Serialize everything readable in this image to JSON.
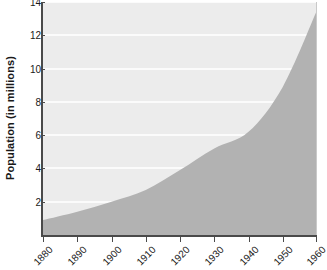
{
  "chart_data": {
    "type": "area",
    "title": "",
    "xlabel": "",
    "ylabel": "Population (in millions)",
    "xlim": [
      1880,
      1960
    ],
    "ylim": [
      0,
      14
    ],
    "grid": true,
    "legend": "none",
    "x_ticks": [
      "1880",
      "1890",
      "1900",
      "1910",
      "1920",
      "1930",
      "1940",
      "1950",
      "1960"
    ],
    "y_ticks": [
      "2",
      "4",
      "6",
      "8",
      "10",
      "12",
      "14"
    ],
    "series": [
      {
        "name": "Population",
        "fill_color": "#b2b2b2",
        "x": [
          1880,
          1890,
          1900,
          1910,
          1920,
          1930,
          1940,
          1950,
          1960
        ],
        "values": [
          0.9,
          1.4,
          2.0,
          2.7,
          3.9,
          5.2,
          6.2,
          8.9,
          13.5
        ]
      }
    ],
    "plot_background": "#ececec",
    "gridline_color": "#fbfbfb",
    "axis_color": "#4a4a4a"
  }
}
